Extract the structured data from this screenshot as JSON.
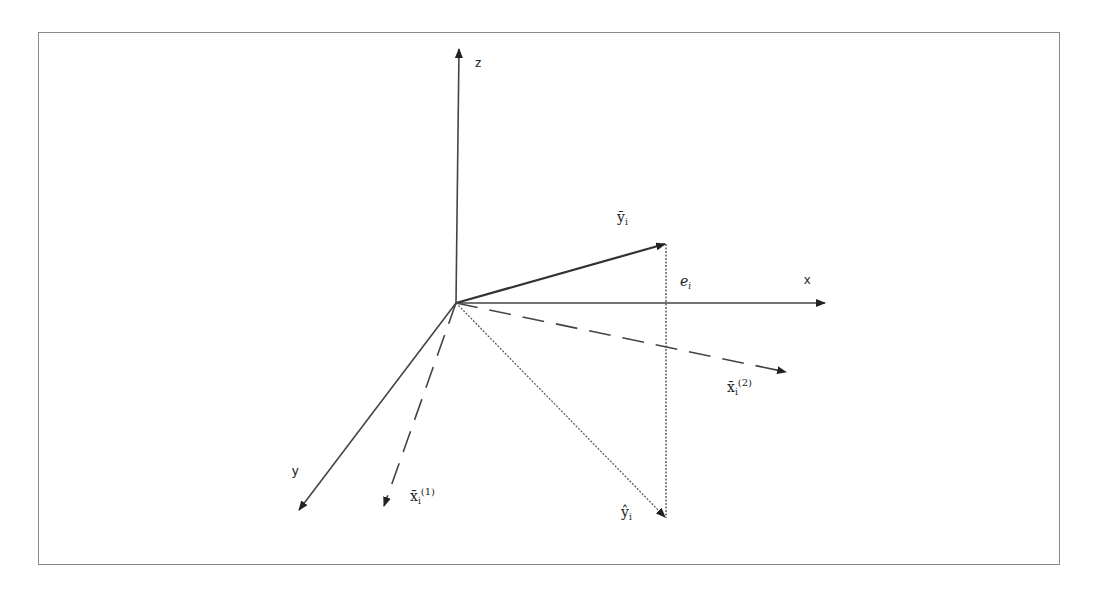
{
  "diagram": {
    "title": "",
    "axes": {
      "x_label": "x",
      "y_label": "y",
      "z_label": "z"
    },
    "vectors": {
      "y_bar": {
        "base": "ȳ",
        "sub": "i",
        "style": "solid"
      },
      "y_hat": {
        "base": "ŷ",
        "sub": "i",
        "style": "dotted"
      },
      "x1_bar": {
        "base": "x̄",
        "sub": "i",
        "sup": "(1)",
        "style": "dashed"
      },
      "x2_bar": {
        "base": "x̄",
        "sub": "i",
        "sup": "(2)",
        "style": "dashed"
      },
      "error": {
        "base": "e",
        "sub": "i",
        "style": "dotted"
      }
    },
    "colors": {
      "line": "#333333",
      "frame": "#8a8a8a"
    }
  }
}
